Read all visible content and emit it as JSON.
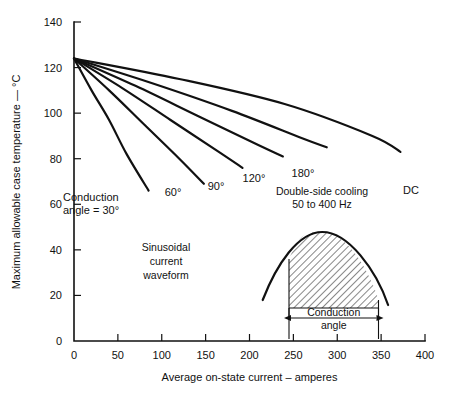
{
  "chart_data": {
    "type": "line",
    "title": "",
    "xlabel": "Average on-state current – amperes",
    "ylabel": "Maximum allowable case temperature — °C",
    "xlim": [
      0,
      400
    ],
    "ylim": [
      0,
      140
    ],
    "xticks": [
      "0",
      "50",
      "100",
      "150",
      "200",
      "250",
      "300",
      "350",
      "400"
    ],
    "xtick_values": [
      0,
      50,
      100,
      150,
      200,
      250,
      300,
      350,
      400
    ],
    "yticks": [
      "0",
      "20",
      "40",
      "60",
      "80",
      "100",
      "120",
      "140"
    ],
    "ytick_values": [
      0,
      20,
      40,
      60,
      80,
      100,
      120,
      140
    ],
    "grid": false,
    "legend_position": "inline-curve-labels",
    "common_origin": {
      "x": 0,
      "y": 124
    },
    "series": [
      {
        "name": "Conduction angle = 30°",
        "label": "Conduction\nangle = 30°",
        "points": [
          [
            0,
            124
          ],
          [
            20,
            110
          ],
          [
            40,
            97
          ],
          [
            60,
            82
          ],
          [
            85,
            66
          ]
        ]
      },
      {
        "name": "60°",
        "label": "60°",
        "points": [
          [
            0,
            124
          ],
          [
            40,
            110
          ],
          [
            80,
            95
          ],
          [
            120,
            80
          ],
          [
            148,
            69
          ]
        ]
      },
      {
        "name": "90°",
        "label": "90°",
        "points": [
          [
            0,
            124
          ],
          [
            55,
            111
          ],
          [
            110,
            97
          ],
          [
            165,
            83
          ],
          [
            192,
            76
          ]
        ]
      },
      {
        "name": "120°",
        "label": "120°",
        "points": [
          [
            0,
            124
          ],
          [
            70,
            112
          ],
          [
            140,
            99
          ],
          [
            210,
            86
          ],
          [
            238,
            81
          ]
        ]
      },
      {
        "name": "180°",
        "label": "180°",
        "points": [
          [
            0,
            124
          ],
          [
            90,
            113
          ],
          [
            180,
            101
          ],
          [
            260,
            89
          ],
          [
            288,
            85
          ]
        ]
      },
      {
        "name": "DC",
        "label": "DC",
        "points": [
          [
            0,
            124
          ],
          [
            120,
            115
          ],
          [
            240,
            104
          ],
          [
            340,
            90
          ],
          [
            372,
            83
          ]
        ]
      }
    ],
    "annotations": [
      {
        "name": "cooling-note",
        "lines": [
          "Double-side cooling",
          "50 to 400 Hz"
        ],
        "x": 245,
        "y": 72
      },
      {
        "name": "waveform-note",
        "lines": [
          "Sinusoidal",
          "current",
          "waveform"
        ],
        "x": 100,
        "y": 48
      }
    ],
    "inset": {
      "name": "sinusoidal-waveform-inset",
      "caption_lines": [
        "Conduction",
        "angle"
      ],
      "conduction_start": 245,
      "conduction_end": 347,
      "wave_start": 215,
      "wave_end": 358,
      "peak_x": 283,
      "hatch_fill": "diagonal-45"
    }
  },
  "colors": {
    "background": "#ffffff",
    "ink": "#111111",
    "hatch": "#111111"
  }
}
